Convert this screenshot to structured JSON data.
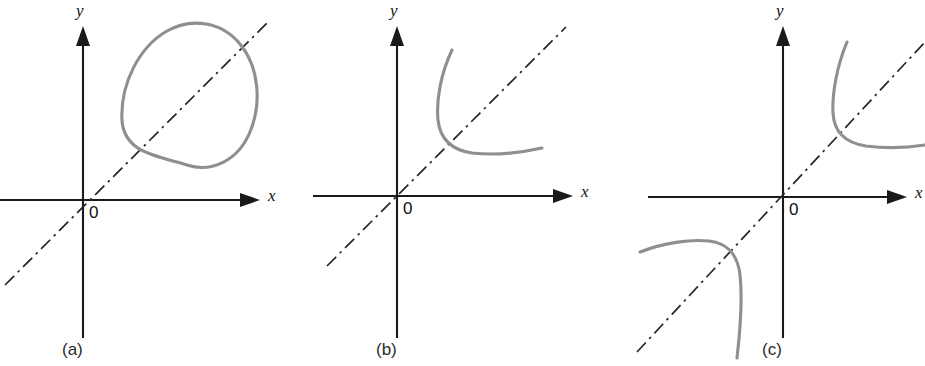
{
  "figure": {
    "width": 925,
    "height": 366,
    "background_color": "#ffffff",
    "axis_color": "#1a1a1a",
    "identity_line_color": "#262626",
    "curve_color": "#8f8f8f",
    "panels": [
      {
        "id": "a",
        "caption": "(a)",
        "caption_x": 62,
        "caption_y": 355,
        "origin": {
          "x": 83,
          "y": 200
        },
        "x_axis": {
          "label": "x",
          "label_x": 268,
          "label_y": 201,
          "start_x": 0,
          "end_x": 258,
          "y": 200
        },
        "y_axis": {
          "label": "y",
          "label_x": 76,
          "label_y": 16,
          "x": 83,
          "start_y": 28,
          "end_y": 338
        },
        "origin_label": "0",
        "origin_label_x": 89,
        "origin_label_y": 218,
        "identity_line": {
          "x1": 5,
          "y1": 285,
          "x2": 268,
          "y2": 22
        },
        "curve_type": "ellipse",
        "curve_path": "M 122 121 C 120 84 139 47 167 31 C 192 17 222 22 240 44 C 259 67 262 103 250 132 C 238 161 211 173 187 165 C 153 155 125 152 122 121 Z"
      },
      {
        "id": "b",
        "caption": "(b)",
        "caption_x": 376,
        "caption_y": 355,
        "origin": {
          "x": 397,
          "y": 196
        },
        "x_axis": {
          "label": "x",
          "label_x": 581,
          "label_y": 197,
          "start_x": 313,
          "end_x": 571,
          "y": 196
        },
        "y_axis": {
          "label": "y",
          "label_x": 390,
          "label_y": 16,
          "x": 397,
          "start_y": 28,
          "end_y": 338
        },
        "origin_label": "0",
        "origin_label_x": 403,
        "origin_label_y": 214,
        "identity_line": {
          "x1": 327,
          "y1": 266,
          "x2": 566,
          "y2": 27
        },
        "curve_type": "hyperbola-branch",
        "curve_path": "M 452 50 C 441 73 436 100 438 120 C 440 139 452 150 472 153 C 498 156 524 152 542 148"
      },
      {
        "id": "c",
        "caption": "(c)",
        "caption_x": 762,
        "caption_y": 355,
        "origin": {
          "x": 783,
          "y": 197
        },
        "x_axis": {
          "label": "x",
          "label_x": 915,
          "label_y": 198,
          "start_x": 648,
          "end_x": 905,
          "y": 197
        },
        "y_axis": {
          "label": "y",
          "label_x": 776,
          "label_y": 16,
          "x": 783,
          "start_y": 28,
          "end_y": 338
        },
        "origin_label": "0",
        "origin_label_x": 789,
        "origin_label_y": 215,
        "identity_line": {
          "x1": 637,
          "y1": 352,
          "x2": 925,
          "y2": 42
        },
        "curve_type": "hyperbola-two-branches",
        "curve_path_upper": "M 847 42 C 837 66 832 93 833 113 C 834 132 846 143 866 146 C 890 149 912 147 925 145",
        "curve_path_lower": "M 640 252 C 663 243 690 239 709 241 C 728 243 738 256 740 275 C 743 302 740 332 737 358"
      }
    ]
  }
}
